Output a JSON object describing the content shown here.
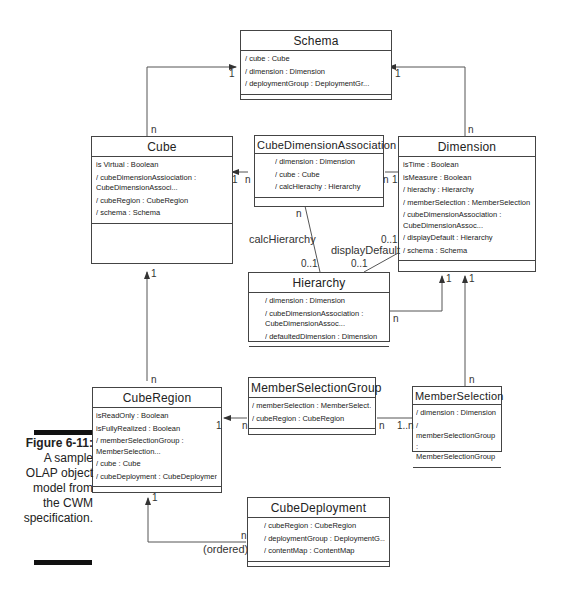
{
  "caption": {
    "figure": "Figure 6-11:",
    "lines": [
      "A sample",
      "OLAP object",
      "model from",
      "the CWM",
      "specification."
    ]
  },
  "classes": {
    "schema": {
      "name": "Schema",
      "attrs": [
        "/ cube : Cube",
        "/ dimension : Dimension",
        "/ deploymentGroup : DeploymentGr..."
      ]
    },
    "cube": {
      "name": "Cube",
      "attrs": [
        "is Virtual : Boolean",
        "/ cubeDimensionAssiociation : CubeDimensionAssoci...",
        "/ cubeRegion : CubeRegion",
        "/ schema : Schema"
      ]
    },
    "cubeDimensionAssociation": {
      "name": "CubeDimensionAssociation",
      "attrs": [
        "/ dimension : Dimension",
        "/ cube : Cube",
        "/ calcHierachy : Hierarchy"
      ]
    },
    "dimension": {
      "name": "Dimension",
      "attrs": [
        "isTime : Boolean",
        "isMeasure : Boolean",
        "/ hierachy : Hierarchy",
        "/ memberSelection : MemberSelection",
        "/ cubeDimensionAssociation : CubeDimensionAssoc...",
        "/ displayDefault : Hierarchy",
        "/ schema : Schema"
      ]
    },
    "hierarchy": {
      "name": "Hierarchy",
      "attrs": [
        "/ dimension : Dimension",
        "/ cubeDimensionAssociation : CubeDimensionAssoc...",
        "/ defaultedDimension : Dimension"
      ]
    },
    "cubeRegion": {
      "name": "CubeRegion",
      "attrs": [
        "isReadOnly : Boolean",
        "isFullyRealized : Boolean",
        "/ memberSelectionGroup : MemberSelection...",
        "/ cube : Cube",
        "/ cubeDeployment : CubeDeployment"
      ]
    },
    "memberSelectionGroup": {
      "name": "MemberSelectionGroup",
      "attrs": [
        "/ memberSelection : MemberSelect...",
        "/ cubeRegion : CubeRegion"
      ]
    },
    "memberSelection": {
      "name": "MemberSelection",
      "attrs": [
        "/ dimension : Dimension",
        "/ memberSelectionGroup : MemberSelectionGroup"
      ]
    },
    "cubeDeployment": {
      "name": "CubeDeployment",
      "attrs": [
        "/ cubeRegion : CubeRegion",
        "/ deploymentGroup : DeploymentG...",
        "/ contentMap : ContentMap"
      ]
    }
  },
  "labels": {
    "schema_cube_1": "1",
    "schema_cube_n": "n",
    "schema_dim_1": "1",
    "schema_dim_n": "n",
    "cube_cda_1": "1",
    "cube_cda_n": "n",
    "cda_dim_n": "n",
    "cda_dim_1": "1",
    "cda_hier_n": "n",
    "calcHierarchy": "calcHierarchy",
    "calc_01": "0..1",
    "displayDefault": "displayDefault",
    "dd_01_top": "0..1",
    "dd_01_bottom": "0..1",
    "hier_dim_n": "n",
    "hier_dim_1": "1",
    "ms_dim_1": "1",
    "ms_dim_n": "n",
    "cube_region_1": "1",
    "cube_region_n": "n",
    "cr_msg_1": "1",
    "cr_msg_n": "n",
    "msg_ms_n": "n",
    "msg_ms_1n": "1..n",
    "cr_cd_1": "1",
    "cr_cd_n": "n",
    "ordered": "(ordered)"
  }
}
